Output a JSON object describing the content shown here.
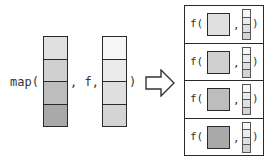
{
  "left": {
    "map_open": "map(",
    "comma_f": ", f,",
    "close": ")",
    "input_vector_colors": [
      "#e0e0e0",
      "#d0d0d0",
      "#bdbdbd",
      "#a9a9a9"
    ],
    "arg_vector_colors": [
      "#f6f6f6",
      "#ebebeb",
      "#dfdfdf",
      "#d4d4d4"
    ]
  },
  "arrow": {
    "icon": "right-arrow-icon"
  },
  "right": {
    "rows": [
      {
        "f_open": "f(",
        "comma": ",",
        "close": ")",
        "square_color": "#e0e0e0",
        "highlight_index": 3
      },
      {
        "f_open": "f(",
        "comma": ",",
        "close": ")",
        "square_color": "#d0d0d0",
        "highlight_index": 3
      },
      {
        "f_open": "f(",
        "comma": ",",
        "close": ")",
        "square_color": "#bdbdbd",
        "highlight_index": 3
      },
      {
        "f_open": "f(",
        "comma": ",",
        "close": ")",
        "square_color": "#a9a9a9",
        "highlight_index": 3
      }
    ],
    "mini_vector_colors": [
      "#f6f6f6",
      "#ebebeb",
      "#dfdfdf",
      "#d4d4d4"
    ]
  }
}
